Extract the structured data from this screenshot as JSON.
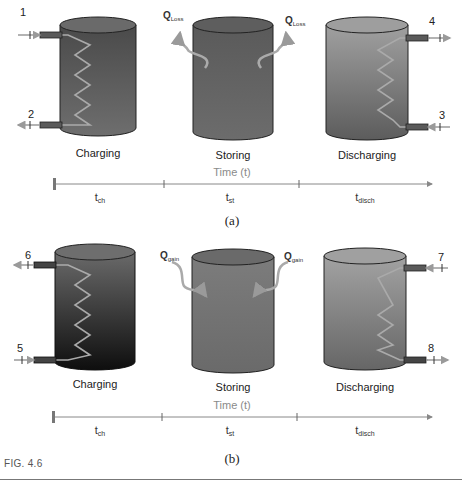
{
  "figure": {
    "caption": "FIG. 4.6",
    "panels": [
      {
        "id": "a",
        "label": "(a)",
        "stages": [
          {
            "name": "Charging",
            "ports": [
              {
                "num": "1",
                "direction": "in",
                "side": "left",
                "position": "top"
              },
              {
                "num": "2",
                "direction": "out",
                "side": "left",
                "position": "bottom"
              }
            ],
            "fill_top": "#4a4a4a",
            "fill_bottom": "#6a6a6a"
          },
          {
            "name": "Storing",
            "heat_labels": [
              {
                "text": "Q",
                "sub": "Loss",
                "direction": "out"
              },
              {
                "text": "Q",
                "sub": "Loss",
                "direction": "out"
              }
            ],
            "fill_top": "#5a5a5a",
            "fill_bottom": "#6a6a6a"
          },
          {
            "name": "Discharging",
            "ports": [
              {
                "num": "4",
                "direction": "out",
                "side": "right",
                "position": "top"
              },
              {
                "num": "3",
                "direction": "in",
                "side": "right",
                "position": "bottom"
              }
            ],
            "fill_top": "#9a9a9a",
            "fill_bottom": "#5e5e5e"
          }
        ],
        "timeline": {
          "axis_label": "Time (t)",
          "segments": [
            {
              "t": "t",
              "sub": "ch"
            },
            {
              "t": "t",
              "sub": "st"
            },
            {
              "t": "t",
              "sub": "disch"
            }
          ]
        }
      },
      {
        "id": "b",
        "label": "(b)",
        "stages": [
          {
            "name": "Charging",
            "ports": [
              {
                "num": "6",
                "direction": "out",
                "side": "left",
                "position": "top"
              },
              {
                "num": "5",
                "direction": "in",
                "side": "left",
                "position": "bottom"
              }
            ],
            "fill_top": "#6a6a6a",
            "fill_bottom": "#111111"
          },
          {
            "name": "Storing",
            "heat_labels": [
              {
                "text": "Q",
                "sub": "gain",
                "direction": "in"
              },
              {
                "text": "Q",
                "sub": "gain",
                "direction": "in"
              }
            ],
            "fill_top": "#7a7a7a",
            "fill_bottom": "#6a6a6a"
          },
          {
            "name": "Discharging",
            "ports": [
              {
                "num": "7",
                "direction": "in",
                "side": "right",
                "position": "top"
              },
              {
                "num": "8",
                "direction": "out",
                "side": "right",
                "position": "bottom"
              }
            ],
            "fill_top": "#9a9a9a",
            "fill_bottom": "#6a6a6a"
          }
        ],
        "timeline": {
          "axis_label": "Time (t)",
          "segments": [
            {
              "t": "t",
              "sub": "ch"
            },
            {
              "t": "t",
              "sub": "st"
            },
            {
              "t": "t",
              "sub": "disch"
            }
          ]
        }
      }
    ]
  }
}
